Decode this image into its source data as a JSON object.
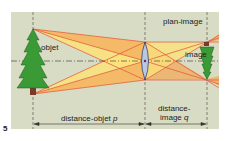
{
  "figure": {
    "number": "5",
    "labels": {
      "object": "objet",
      "image": "image",
      "image_plane": "plan-image",
      "object_distance": "distance-objet",
      "object_distance_var": "p",
      "image_distance_line1": "distance-",
      "image_distance_line2": "image",
      "image_distance_var": "q"
    },
    "colors": {
      "background": "#d9dcc4",
      "ray_light": "#fbe27a",
      "ray_dark": "#f2a95a",
      "ray_line": "#e0503a",
      "tree": "#3a9a35",
      "trunk": "#7a3a2a",
      "lens": "#b8c8e0",
      "axis": "#333333"
    }
  }
}
